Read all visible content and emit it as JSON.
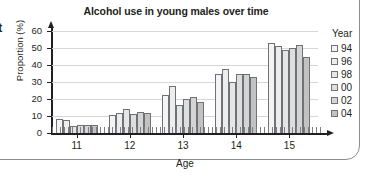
{
  "edge_fragment": "t",
  "chart_data": {
    "type": "bar",
    "title": "Alcohol use in young males over time",
    "xlabel": "Age",
    "ylabel": "Proportion (%)",
    "categories": [
      "11",
      "12",
      "13",
      "14",
      "15"
    ],
    "ylim": [
      0,
      60
    ],
    "yticks": [
      "0",
      "10",
      "20",
      "30",
      "40",
      "50",
      "60"
    ],
    "grid": true,
    "legend_title": "Year",
    "legend_position": "right",
    "series": [
      {
        "name": "94",
        "color": "#f4f4f4",
        "values": [
          8,
          10.5,
          22.5,
          34.5,
          53
        ]
      },
      {
        "name": "96",
        "color": "#ededed",
        "values": [
          7.5,
          12,
          27.5,
          37.5,
          51
        ]
      },
      {
        "name": "98",
        "color": "#e6e6e6",
        "values": [
          4,
          14,
          16.5,
          30,
          49
        ]
      },
      {
        "name": "00",
        "color": "#dedede",
        "values": [
          5,
          11,
          20,
          35,
          50
        ]
      },
      {
        "name": "02",
        "color": "#d4d4d4",
        "values": [
          5,
          12.5,
          21,
          35,
          52
        ]
      },
      {
        "name": "04",
        "color": "#c2c2c2",
        "values": [
          5,
          11.5,
          18,
          33,
          45
        ]
      }
    ]
  }
}
